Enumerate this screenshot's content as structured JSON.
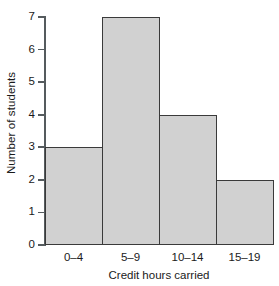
{
  "chart_data": {
    "type": "bar",
    "title": "",
    "subtitle": "",
    "xlabel": "Credit hours carried",
    "ylabel": "Number of students",
    "categories": [
      "0–4",
      "5–9",
      "10–14",
      "15–19"
    ],
    "values": [
      3,
      7,
      4,
      2
    ],
    "series": [
      {
        "name": "Number of students",
        "values": [
          3,
          7,
          4,
          2
        ]
      }
    ],
    "ylim": [
      0,
      7
    ],
    "y_ticks": [
      0,
      1,
      2,
      3,
      4,
      5,
      6,
      7
    ],
    "y_tick_labels": [
      "0",
      "1",
      "2",
      "3",
      "4",
      "5",
      "6",
      "7"
    ],
    "grid": false,
    "legend": false,
    "legend_position": "none",
    "annotations": [],
    "bar_fill_color": "#d1d1d1",
    "bar_edge_color": "#3a3a3a",
    "axis_color": "#555b5e",
    "background_color": "#ffffff",
    "bar_gap": 0
  }
}
